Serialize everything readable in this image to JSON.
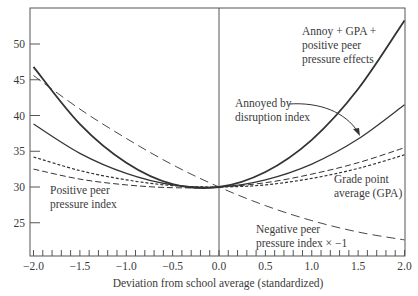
{
  "chart_data": {
    "type": "line",
    "title": "",
    "xlabel": "Deviation from school average (standardized)",
    "ylabel": "",
    "xlim": [
      -2.0,
      2.0
    ],
    "ylim": [
      20.4,
      55.8
    ],
    "x_ticks": [
      "-2.0",
      "-1.5",
      "-1.0",
      "-0.5",
      "0.0",
      "0.5",
      "1.0",
      "1.5",
      "2.0"
    ],
    "y_ticks": [
      "25",
      "30",
      "35",
      "40",
      "45",
      "50"
    ],
    "grid": false,
    "x": [
      -2.0,
      -1.5,
      -1.0,
      -0.5,
      0.0,
      0.5,
      1.0,
      1.5,
      2.0
    ],
    "series": [
      {
        "name": "Annoy + GPA + positive peer pressure effects",
        "style": "solid-thick",
        "values": [
          46.8,
          38.8,
          33.4,
          30.4,
          30.0,
          32.1,
          36.6,
          43.7,
          53.3
        ]
      },
      {
        "name": "Annoyed by disruption index",
        "style": "solid",
        "values": [
          38.8,
          34.7,
          31.9,
          30.3,
          30.0,
          31.0,
          33.2,
          36.7,
          41.5
        ]
      },
      {
        "name": "Grade point average (GPA)",
        "style": "short-dash",
        "values": [
          34.2,
          32.3,
          31.0,
          30.2,
          30.0,
          30.3,
          31.2,
          32.6,
          34.5
        ]
      },
      {
        "name": "Positive peer pressure index",
        "style": "long-dash",
        "values": [
          32.5,
          31.1,
          30.3,
          29.9,
          30.0,
          30.6,
          31.8,
          33.4,
          35.5
        ]
      },
      {
        "name": "Negative peer pressure index × −1",
        "style": "long-dash-thin",
        "values": [
          45.6,
          40.9,
          36.8,
          33.1,
          30.0,
          27.4,
          25.3,
          23.7,
          22.6
        ]
      }
    ],
    "annotations": [
      {
        "text": [
          "Annoy + GPA +",
          "positive peer",
          "pressure effects"
        ]
      },
      {
        "text": [
          "Annoyed by",
          "disruption index"
        ],
        "arrow": true
      },
      {
        "text": [
          "Grade point",
          "average (GPA)"
        ]
      },
      {
        "text": [
          "Positive peer",
          "pressure index"
        ]
      },
      {
        "text": [
          "Negative peer",
          "pressure index × −1"
        ]
      }
    ],
    "legend_position": "none"
  },
  "labels": {
    "annoy_gpa_1": "Annoy + GPA +",
    "annoy_gpa_2": "positive peer",
    "annoy_gpa_3": "pressure effects",
    "annoyed_1": "Annoyed by",
    "annoyed_2": "disruption index",
    "gpa_1": "Grade point",
    "gpa_2": "average (GPA)",
    "positive_1": "Positive peer",
    "positive_2": "pressure index",
    "negative_1": "Negative peer",
    "negative_2": "pressure index × −1",
    "xlabel": "Deviation from school average (standardized)"
  },
  "y_tick_labels": [
    "50",
    "45",
    "40",
    "35",
    "30",
    "25"
  ],
  "x_tick_labels": [
    "−2.0",
    "−1.5",
    "−1.0",
    "−0.5",
    "0.0",
    "0.5",
    "1.0",
    "1.5",
    "2.0"
  ]
}
